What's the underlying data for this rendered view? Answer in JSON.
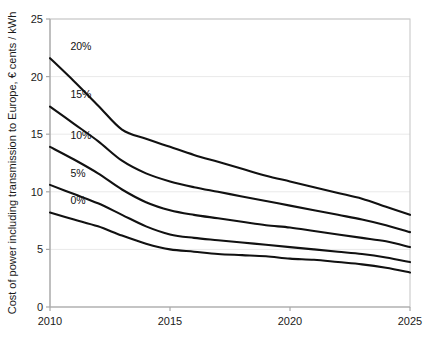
{
  "chart_data": {
    "type": "line",
    "title": "",
    "xlabel": "",
    "ylabel": "Cost of power including transmission to Europe, € cents / kWh",
    "xlim": [
      2010,
      2025
    ],
    "ylim": [
      0,
      25
    ],
    "xticks": [
      2010,
      2015,
      2020,
      2025
    ],
    "xtick_labels": [
      "2010",
      "2015",
      "2020",
      "2025"
    ],
    "yticks": [
      0,
      5,
      10,
      15,
      20,
      25
    ],
    "ytick_labels": [
      "0",
      "5",
      "10",
      "15",
      "20",
      "25"
    ],
    "grid": true,
    "grid_axis": "y",
    "legend": "inline-labels",
    "legend_position": "left-of-curve-start",
    "line_color": "#111111",
    "background_color": "#ffffff",
    "x": [
      2010,
      2011,
      2012,
      2013,
      2014,
      2015,
      2016,
      2017,
      2018,
      2019,
      2020,
      2021,
      2022,
      2023,
      2024,
      2025
    ],
    "series": [
      {
        "name": "20%",
        "label": "20%",
        "values": [
          21.6,
          19.6,
          17.5,
          15.4,
          14.6,
          13.9,
          13.2,
          12.6,
          12.0,
          11.4,
          10.9,
          10.4,
          9.9,
          9.4,
          8.7,
          8.0
        ]
      },
      {
        "name": "15%",
        "label": "15%",
        "values": [
          17.4,
          15.9,
          14.4,
          12.7,
          11.6,
          10.9,
          10.4,
          10.0,
          9.6,
          9.2,
          8.8,
          8.4,
          8.0,
          7.6,
          7.1,
          6.5
        ]
      },
      {
        "name": "10%",
        "label": "10%",
        "values": [
          13.9,
          12.8,
          11.6,
          10.2,
          9.1,
          8.4,
          8.0,
          7.7,
          7.4,
          7.1,
          6.9,
          6.6,
          6.3,
          6.0,
          5.7,
          5.2
        ]
      },
      {
        "name": "5%",
        "label": "5%",
        "values": [
          10.6,
          9.8,
          9.0,
          8.0,
          7.0,
          6.3,
          6.0,
          5.8,
          5.6,
          5.4,
          5.2,
          5.0,
          4.8,
          4.6,
          4.3,
          3.9
        ]
      },
      {
        "name": "0%",
        "label": "0%",
        "values": [
          8.2,
          7.6,
          7.0,
          6.2,
          5.5,
          5.0,
          4.8,
          4.6,
          4.5,
          4.4,
          4.2,
          4.1,
          3.9,
          3.7,
          3.4,
          3.0
        ]
      }
    ],
    "series_label_positions": [
      {
        "name": "20%",
        "x": 2010.85,
        "y": 22.3
      },
      {
        "name": "15%",
        "x": 2010.85,
        "y": 18.1
      },
      {
        "name": "10%",
        "x": 2010.85,
        "y": 14.6
      },
      {
        "name": "5%",
        "x": 2010.85,
        "y": 11.3
      },
      {
        "name": "0%",
        "x": 2010.85,
        "y": 8.9
      }
    ]
  }
}
